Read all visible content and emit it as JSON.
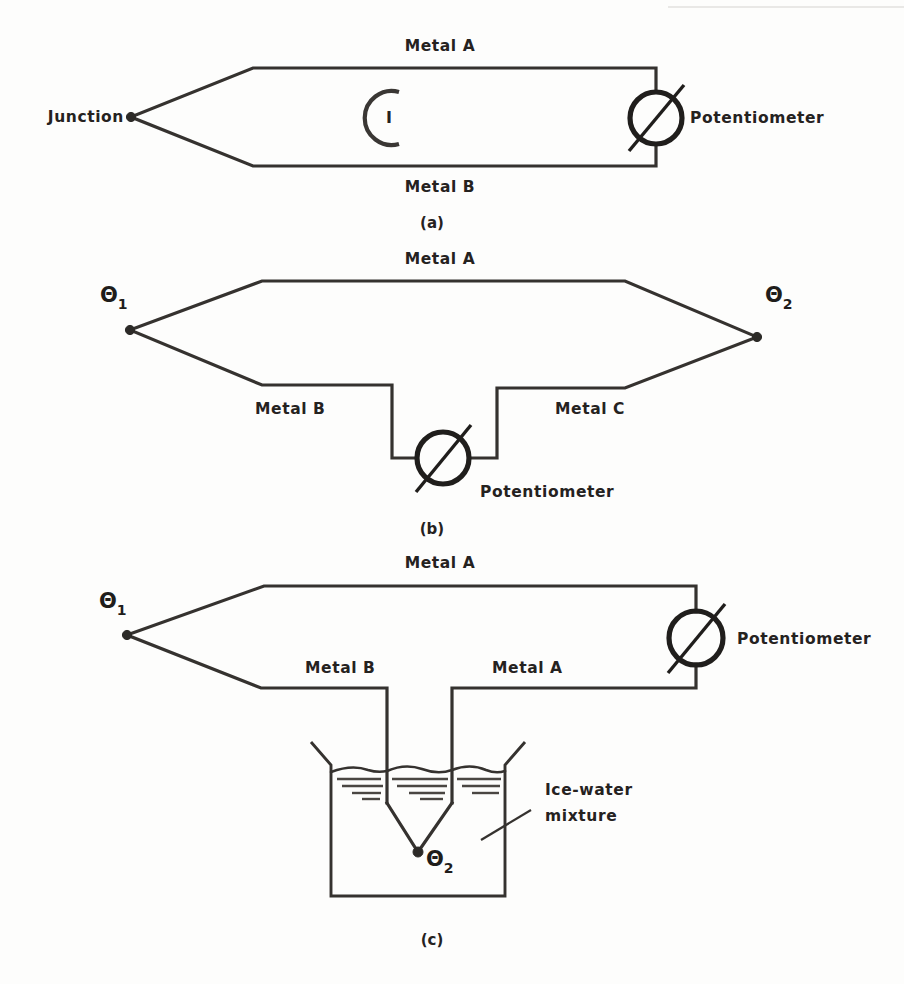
{
  "page": {
    "background_color": "#fdfdfc",
    "ink_color": "#35322f",
    "header_fragment": "",
    "footer_fragment": ""
  },
  "figures": [
    {
      "id": "a",
      "caption": "(a)",
      "labels": {
        "junction": "Junction",
        "metal_top": "Metal A",
        "metal_bottom": "Metal B",
        "current": "I",
        "potentiometer": "Potentiometer"
      }
    },
    {
      "id": "b",
      "caption": "(b)",
      "labels": {
        "theta_left": "Θ",
        "theta_left_sub": "1",
        "theta_right": "Θ",
        "theta_right_sub": "2",
        "metal_top": "Metal A",
        "metal_left": "Metal B",
        "metal_right": "Metal C",
        "potentiometer": "Potentiometer"
      }
    },
    {
      "id": "c",
      "caption": "(c)",
      "labels": {
        "theta_left": "Θ",
        "theta_left_sub": "1",
        "theta_bath": "Θ",
        "theta_bath_sub": "2",
        "metal_top": "Metal A",
        "metal_left": "Metal B",
        "metal_right": "Metal A",
        "potentiometer": "Potentiometer",
        "bath_line1": "Ice-water",
        "bath_line2": "mixture"
      }
    }
  ]
}
